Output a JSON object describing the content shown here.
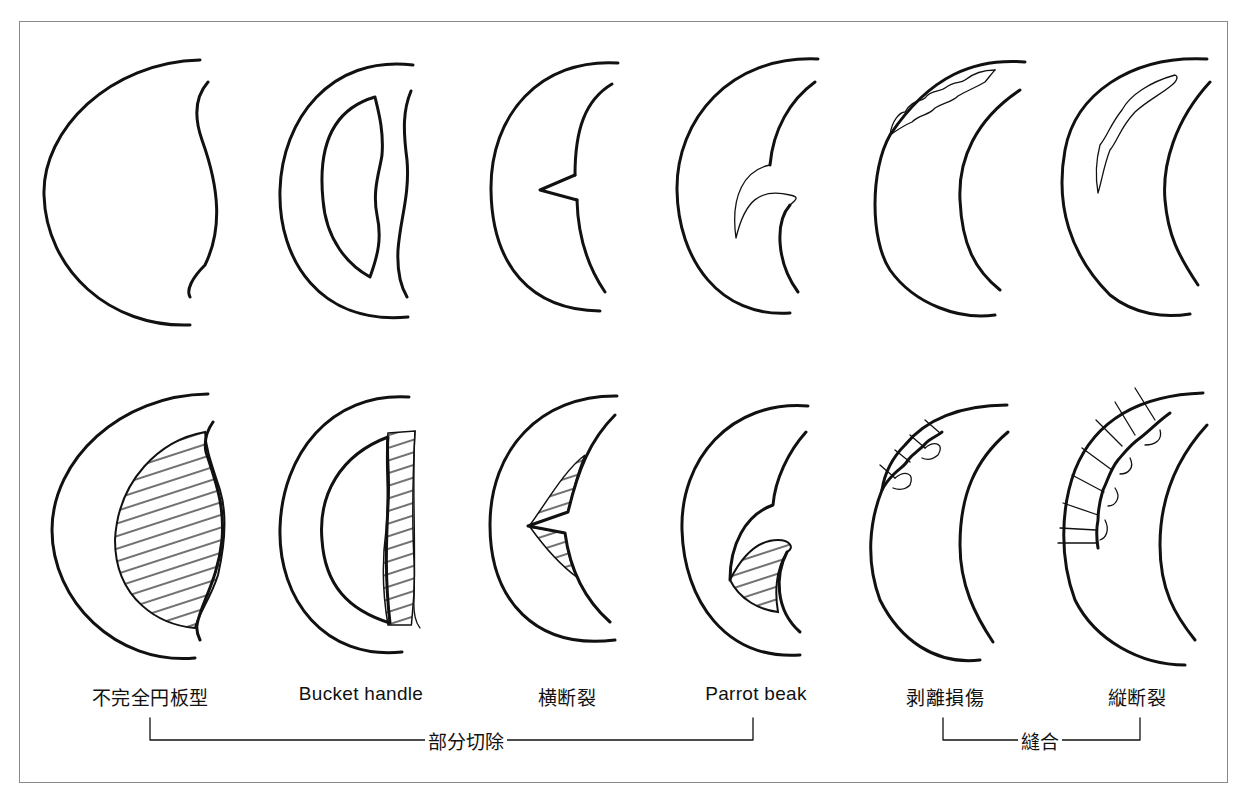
{
  "diagram": {
    "title": "",
    "rows": [
      {
        "name": "tear-type",
        "description": "tear patterns (top row)"
      },
      {
        "name": "treatment",
        "description": "treatment result (bottom row; hatched = resected area, ticks = sutures)"
      }
    ],
    "columns": [
      {
        "label": "不完全円板型",
        "script": "ja"
      },
      {
        "label": "Bucket handle",
        "script": "latin"
      },
      {
        "label": "横断裂",
        "script": "ja"
      },
      {
        "label": "Parrot beak",
        "script": "latin"
      },
      {
        "label": "剥離損傷",
        "script": "ja"
      },
      {
        "label": "縦断裂",
        "script": "ja"
      }
    ],
    "groups": [
      {
        "label": "部分切除",
        "spans": [
          "不完全円板型",
          "Bucket handle",
          "横断裂",
          "Parrot beak"
        ]
      },
      {
        "label": "縫合",
        "spans": [
          "剥離損傷",
          "縦断裂"
        ]
      }
    ],
    "colors": {
      "stroke": "#111111",
      "frame": "#8a8a8a",
      "background": "#ffffff"
    }
  }
}
